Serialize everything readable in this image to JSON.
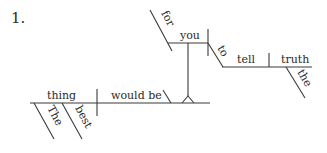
{
  "diagram": {
    "number": "1.",
    "words": {
      "subject": "thing",
      "verb": "would be",
      "subject_mod_1": "The",
      "subject_mod_2": "best",
      "infinitive_subject_prep": "for",
      "infinitive_subject": "you",
      "infinitive_marker": "to",
      "infinitive_verb": "tell",
      "object": "truth",
      "object_mod": "the"
    },
    "colors": {
      "line": "#3a3a3a",
      "text": "#2a2a2a",
      "background": "#ffffff"
    }
  }
}
